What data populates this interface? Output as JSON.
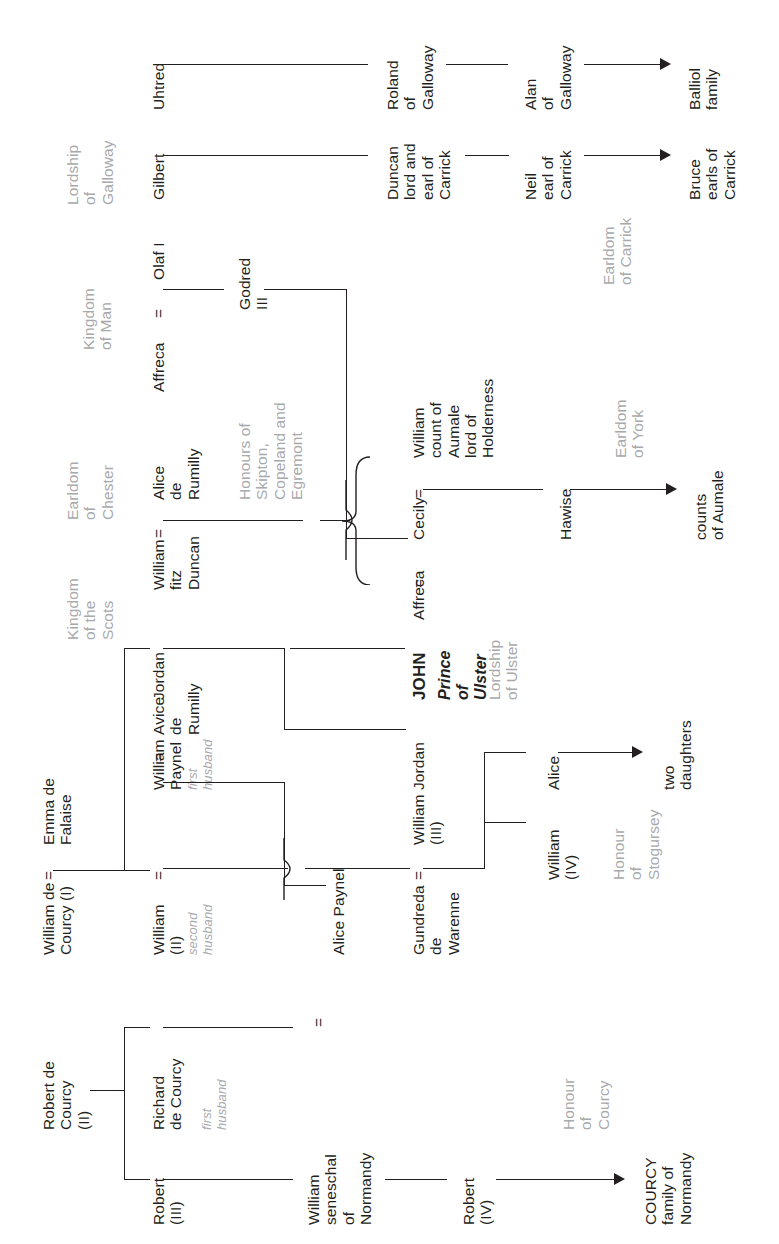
{
  "diagram": {
    "orientation": "text-rotated-90-ccw",
    "text_color": "#231f20",
    "annotation_color": "#a7a9ac"
  },
  "column_headers": [
    {
      "id": "lordship-of-galloway",
      "lines": "Lordship\nof\nGalloway"
    },
    {
      "id": "kingdom-of-man",
      "lines": "Kingdom\nof Man"
    },
    {
      "id": "earldom-of-chester",
      "lines": "Earldom\nof\nChester"
    },
    {
      "id": "kingdom-of-the-scots",
      "lines": "Kingdom\nof the\nScots"
    }
  ],
  "people": {
    "uhtred": "Uhtred",
    "gilbert": "Gilbert",
    "roland_of_galloway": "Roland\nof\nGalloway",
    "duncan_carrick": "Duncan\nlord and\nearl of\nCarrick",
    "alan_of_galloway": "Alan\nof\nGalloway",
    "neil_carrick": "Neil\nearl of\nCarrick",
    "balliol_family": "Balliol\nfamily",
    "bruce_earls_carrick": "Bruce\nearls of\nCarrick",
    "olaf_i": "Olaf I",
    "affreca_olaf": "Affreca",
    "godred_iii": "Godred\nIII",
    "william_fitz_duncan": "William\nfitz\nDuncan",
    "alice_de_rumilly": "Alice\nde\nRumilly",
    "cecily": "Cecily",
    "william_count_of_aumale": "William\ncount of\nAumale\nlord of\nHolderness",
    "affreca_john": "Affreca",
    "hawise": "Hawise",
    "counts_of_aumale": "counts\nof Aumale",
    "jordan_top": "Jordan",
    "john": "JOHN",
    "john_title": "Prince\nof\nUlster",
    "jordan_mid": "Jordan",
    "william_paynel": "William\nPaynel",
    "avice_de_rumilly": "Avice\nde\nRumilly",
    "william_ii": "William\n(II)",
    "alice_paynel": "Alice  Paynel",
    "william_iii": "William\n(III)",
    "gundreda_de_warenne": "Gundreda\nde\nWarenne",
    "alice_daughter": "Alice",
    "william_iv": "William\n(IV)",
    "two_daughters": "two\ndaughters",
    "william_de_courcy_i": "William de\nCourcy (I)",
    "emma_de_falaise": "Emma de\nFalaise",
    "robert_de_courcy_ii": "Robert de\nCourcy\n(II)",
    "richard_de_courcy": "Richard\nde Courcy",
    "robert_iii": "Robert\n(III)",
    "william_seneschal": "William\nseneschal\nof\nNormandy",
    "robert_iv": "Robert\n(IV)",
    "courcy_family_normandy": "COURCY\nfamily of\nNormandy"
  },
  "annotations": {
    "earldom_of_carrick": "Earldom\nof Carrick",
    "honours_skipton": "Honours of\nSkipton,\nCopeland and\nEgremont",
    "earldom_of_york": "Earldom\nof York",
    "lordship_of_ulster": "Lordship\nof Ulster",
    "first_husband_paynel": "first\nhusband",
    "second_husband_courcy": "second\nhusband",
    "first_husband_richard": "first\nhusband",
    "honour_of_stogursey": "Honour\nof\nStogursey",
    "honour_of_courcy": "Honour\nof\nCourcy"
  },
  "symbols": {
    "marriage": "="
  }
}
